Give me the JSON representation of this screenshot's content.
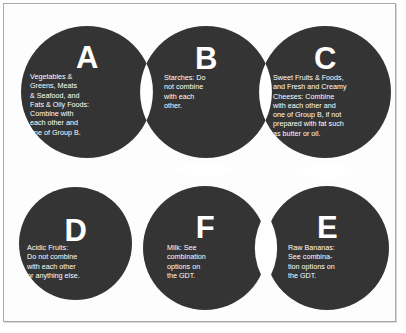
{
  "figure": {
    "circle_color": "#343434",
    "text_color": "#ffffff",
    "background_color": "#ffffff",
    "frame_color": "#a8a8a8"
  },
  "groups": [
    {
      "id": "A",
      "letter": "A",
      "text": "Vegetables &\nGreens, Meats\n& Seafood, and\nFats & Oily Foods:\nCombine with\neach other and\none of Group B.",
      "row": "top",
      "column": 1
    },
    {
      "id": "B",
      "letter": "B",
      "text": "Starches: Do\nnot combine\nwith each\nother.",
      "row": "top",
      "column": 2
    },
    {
      "id": "C",
      "letter": "C",
      "text": "Sweet Fruits & Foods,\nand Fresh and Creamy\nCheeses: Combine\nwith each other and\none of Group B, if not\nprepared with fat such\nas butter or oil.",
      "row": "top",
      "column": 3
    },
    {
      "id": "D",
      "letter": "D",
      "text": "Acidic Fruits:\nDo not combine\nwith each other\nor anything else.",
      "row": "bottom",
      "column": 1
    },
    {
      "id": "F",
      "letter": "F",
      "text": "Milk: See\ncombination\noptions on\nthe GDT.",
      "row": "bottom",
      "column": 2
    },
    {
      "id": "E",
      "letter": "E",
      "text": "Raw Bananas:\nSee combina-\ntion options on\nthe GDT.",
      "row": "bottom",
      "column": 3
    }
  ]
}
